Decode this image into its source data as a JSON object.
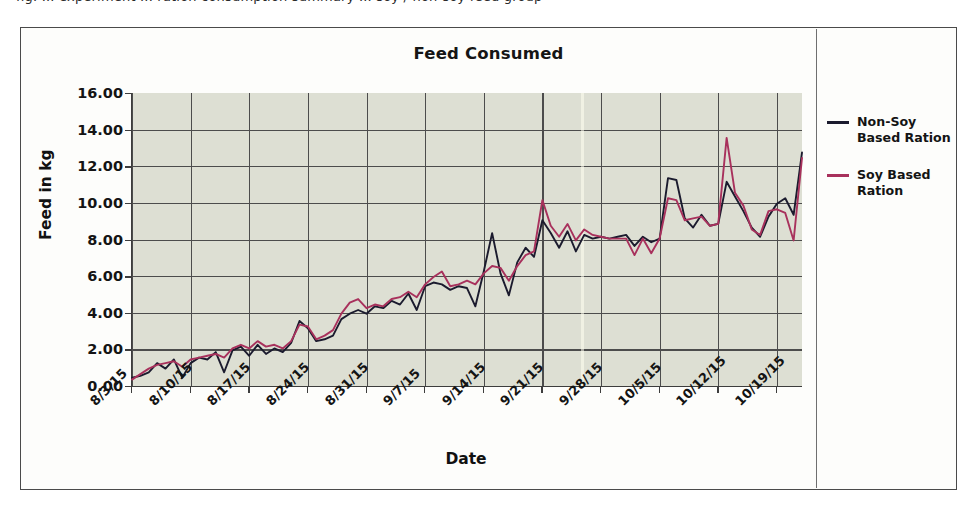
{
  "page": {
    "top_text_sliver": "fig. ... experiment ... ration consumption summary ... soy / non-soy feed group"
  },
  "figure": {
    "title": "Feed Consumed",
    "xlabel": "Date",
    "ylabel": "Feed in kg"
  },
  "legend": {
    "position": "right",
    "items": [
      {
        "label": "Non-Soy Based Ration",
        "color": "#1b1b2e"
      },
      {
        "label": "Soy Based Ration",
        "color": "#a8315c"
      }
    ]
  },
  "axes": {
    "y_ticks": [
      "16.00",
      "14.00",
      "12.00",
      "10.00",
      "8.00",
      "6.00",
      "4.00",
      "2.00",
      "0.00"
    ],
    "x_ticks": [
      "8/3/15",
      "8/10/15",
      "8/17/15",
      "8/24/15",
      "8/31/15",
      "9/7/15",
      "9/14/15",
      "9/21/15",
      "9/28/15",
      "10/5/15",
      "10/12/15",
      "10/19/15"
    ]
  },
  "colors": {
    "plot_background": "#dddfd3",
    "gridline": "#4c4c4c",
    "frame": "#4a4a4a",
    "non_soy": "#1b1b2e",
    "soy": "#a8315c"
  },
  "chart_data": {
    "type": "line",
    "title": "Feed Consumed",
    "xlabel": "Date",
    "ylabel": "Feed in kg",
    "ylim": [
      0,
      16
    ],
    "y_tick_step": 2,
    "grid": true,
    "legend_position": "right",
    "x_tick_labels": [
      "8/3/15",
      "8/10/15",
      "8/17/15",
      "8/24/15",
      "8/31/15",
      "9/7/15",
      "9/14/15",
      "9/21/15",
      "9/28/15",
      "10/5/15",
      "10/12/15",
      "10/19/15"
    ],
    "x_tick_indices": [
      0,
      7,
      14,
      21,
      28,
      35,
      42,
      49,
      56,
      63,
      70,
      77
    ],
    "x_start_date": "8/3/15",
    "x_interval_days": 1,
    "n_points": 81,
    "series": [
      {
        "name": "Non-Soy Based Ration",
        "color": "#1b1b2e",
        "values": [
          0.45,
          0.55,
          0.75,
          1.25,
          0.95,
          1.45,
          0.45,
          1.25,
          1.55,
          1.45,
          1.85,
          0.75,
          1.95,
          2.15,
          1.65,
          2.25,
          1.75,
          2.05,
          1.85,
          2.35,
          3.55,
          3.15,
          2.45,
          2.55,
          2.75,
          3.65,
          3.95,
          4.15,
          3.95,
          4.35,
          4.25,
          4.65,
          4.45,
          5.05,
          4.15,
          5.45,
          5.65,
          5.55,
          5.25,
          5.45,
          5.35,
          4.35,
          6.25,
          8.35,
          6.15,
          4.95,
          6.75,
          7.55,
          7.05,
          9.05,
          8.35,
          7.55,
          8.45,
          7.35,
          8.25,
          8.05,
          8.15,
          8.05,
          8.15,
          8.25,
          7.65,
          8.15,
          7.85,
          8.05,
          11.35,
          11.25,
          9.15,
          8.65,
          9.35,
          8.75,
          8.85,
          11.15,
          10.35,
          9.55,
          8.65,
          8.15,
          9.25,
          9.95,
          10.25,
          9.35,
          12.75
        ]
      },
      {
        "name": "Soy Based Ration",
        "color": "#a8315c",
        "values": [
          0.35,
          0.65,
          0.95,
          1.15,
          1.25,
          1.35,
          1.05,
          1.45,
          1.55,
          1.65,
          1.75,
          1.55,
          2.05,
          2.25,
          2.05,
          2.45,
          2.15,
          2.25,
          2.05,
          2.45,
          3.35,
          3.25,
          2.55,
          2.75,
          3.05,
          3.95,
          4.55,
          4.75,
          4.25,
          4.45,
          4.35,
          4.75,
          4.85,
          5.15,
          4.85,
          5.55,
          5.95,
          6.25,
          5.45,
          5.55,
          5.75,
          5.55,
          6.15,
          6.55,
          6.45,
          5.75,
          6.55,
          7.15,
          7.35,
          10.15,
          8.75,
          8.15,
          8.85,
          7.95,
          8.55,
          8.25,
          8.15,
          8.05,
          8.05,
          8.05,
          7.15,
          8.05,
          7.25,
          8.05,
          10.25,
          10.15,
          9.05,
          9.15,
          9.25,
          8.75,
          8.85,
          13.55,
          10.55,
          9.85,
          8.55,
          8.25,
          9.55,
          9.65,
          9.45,
          7.95,
          12.45
        ]
      }
    ]
  }
}
